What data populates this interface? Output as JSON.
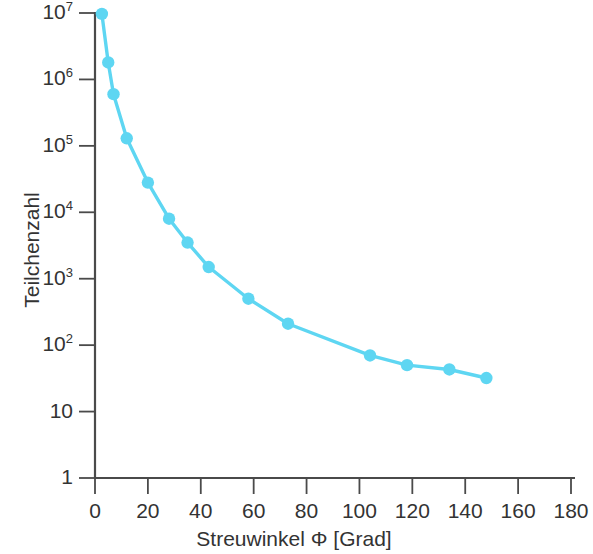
{
  "chart_data": {
    "type": "line",
    "title": "",
    "subtitle": "",
    "xlabel": "Streuwinkel Φ [Grad]",
    "ylabel": "Teilchenzahl",
    "xlim": [
      0,
      180
    ],
    "ylim": [
      1,
      10000000
    ],
    "yscale": "log",
    "xscale": "linear",
    "grid": false,
    "legend": null,
    "legend_position": "none",
    "marker": "circle",
    "series_color": "#5ED6F2",
    "x": [
      2.6,
      5,
      7,
      12,
      20,
      28,
      35,
      43,
      58,
      73,
      104,
      118,
      134,
      148
    ],
    "values": [
      9700000,
      1800000,
      600000,
      130000,
      28000,
      8000,
      3500,
      1500,
      500,
      210,
      70,
      50,
      43,
      32
    ],
    "series": [
      {
        "name": "Teilchenzahl",
        "x": [
          2.6,
          5,
          7,
          12,
          20,
          28,
          35,
          43,
          58,
          73,
          104,
          118,
          134,
          148
        ],
        "values": [
          9700000,
          1800000,
          600000,
          130000,
          28000,
          8000,
          3500,
          1500,
          500,
          210,
          70,
          50,
          43,
          32
        ]
      }
    ],
    "xticks": [
      0,
      20,
      40,
      60,
      80,
      100,
      120,
      140,
      160,
      180
    ],
    "xtick_labels": [
      "0",
      "20",
      "40",
      "60",
      "80",
      "100",
      "120",
      "140",
      "160",
      "180"
    ],
    "yticks": [
      1,
      10,
      100,
      1000,
      10000,
      100000,
      1000000,
      10000000
    ],
    "ytick_labels": [
      {
        "base": "1",
        "exp": ""
      },
      {
        "base": "10",
        "exp": ""
      },
      {
        "base": "10",
        "exp": "2"
      },
      {
        "base": "10",
        "exp": "3"
      },
      {
        "base": "10",
        "exp": "4"
      },
      {
        "base": "10",
        "exp": "5"
      },
      {
        "base": "10",
        "exp": "6"
      },
      {
        "base": "10",
        "exp": "7"
      }
    ]
  },
  "axes": {
    "x_title": "Streuwinkel Φ [Grad]",
    "y_title": "Teilchenzahl"
  },
  "style": {
    "axis_color": "#4a4a4a",
    "line_color": "#5ED6F2",
    "marker_color": "#5ED6F2",
    "background": "#ffffff",
    "text_color": "#333333"
  }
}
